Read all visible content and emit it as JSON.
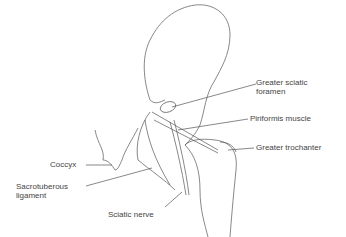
{
  "diagram": {
    "labels": {
      "greater_sciatic_foramen_1": "Greater sciatic",
      "greater_sciatic_foramen_2": "foramen",
      "piriformis": "Piriformis muscle",
      "greater_trochanter": "Greater trochanter",
      "coccyx": "Coccyx",
      "sacrotuberous_1": "Sacrotuberous",
      "sacrotuberous_2": "ligament",
      "sciatic_nerve": "Sciatic nerve"
    }
  }
}
